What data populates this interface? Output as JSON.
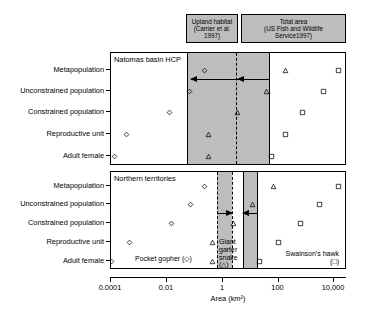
{
  "figure": {
    "xlabel": "Area (km²)",
    "headers": [
      {
        "id": "upland",
        "line1": "Upland habitat",
        "line2": "(Carrier et al. 1997)"
      },
      {
        "id": "total",
        "line1": "Total area",
        "line2": "(US Fish and Wildlife",
        "line3": "Service1997)"
      }
    ],
    "x_ticks": [
      {
        "label": "0.0001",
        "value": 0.0001
      },
      {
        "label": "0.01",
        "value": 0.01
      },
      {
        "label": "1",
        "value": 1
      },
      {
        "label": "100",
        "value": 100
      },
      {
        "label": "10,000",
        "value": 10000
      }
    ],
    "categories": [
      "Metapopulation",
      "Unconstrained population",
      "Constrained population",
      "Reproductive unit",
      "Adult female"
    ],
    "legend": [
      {
        "name": "pocket-gopher",
        "label": "Pocket gopher",
        "symbol": "◇",
        "marker": "diamond"
      },
      {
        "name": "giant-garter-snake",
        "label": "Giant garter snake",
        "symbol": "△",
        "marker": "triangle"
      },
      {
        "name": "swainsons-hawk",
        "label": "Swainson's hawk",
        "symbol": "□",
        "marker": "square"
      }
    ]
  },
  "panels": [
    {
      "id": "natomas",
      "title": "Natomas basin HCP",
      "bands": [
        {
          "name": "upland-habitat-band",
          "x_start": 186,
          "x_end": 268,
          "left_edge": "solid",
          "right_edge": "solid",
          "divider_x": 235,
          "divider_style": "dotted"
        }
      ],
      "arrows": [
        {
          "name": "upland-arrow",
          "from_x": 237,
          "to_x": 190,
          "row": 0,
          "direction": "left"
        },
        {
          "name": "total-area-arrow",
          "from_x": 268,
          "to_x": 237,
          "row": 0,
          "direction": "left"
        }
      ],
      "series": [
        {
          "name": "pocket-gopher",
          "marker": "diamond",
          "points": [
            203,
            188,
            168,
            125,
            113
          ]
        },
        {
          "name": "giant-garter-snake",
          "marker": "triangle",
          "points": [
            284,
            265,
            236,
            207,
            207
          ]
        },
        {
          "name": "swainsons-hawk",
          "marker": "square",
          "points": [
            337,
            322,
            301,
            284,
            270
          ]
        }
      ]
    },
    {
      "id": "northern",
      "title": "Northern territories",
      "bands": [
        {
          "name": "upland-habitat-band",
          "x_start": 216,
          "x_end": 231,
          "left_edge": "dotted",
          "right_edge": "dotted"
        },
        {
          "name": "total-area-band",
          "x_start": 242,
          "x_end": 256,
          "left_edge": "solid",
          "right_edge": "solid"
        }
      ],
      "arrows": [
        {
          "name": "upland-arrow",
          "from_x": 216,
          "to_x": 231,
          "row": 1,
          "direction": "right"
        },
        {
          "name": "total-area-arrow",
          "from_x": 256,
          "to_x": 242,
          "row": 1,
          "direction": "left"
        }
      ],
      "series": [
        {
          "name": "pocket-gopher",
          "marker": "diamond",
          "points": [
            203,
            189,
            170,
            128,
            110
          ]
        },
        {
          "name": "giant-garter-snake",
          "marker": "triangle",
          "points": [
            272,
            251,
            232,
            211,
            211
          ]
        },
        {
          "name": "swainsons-hawk",
          "marker": "square",
          "points": [
            337,
            318,
            299,
            277,
            258
          ]
        }
      ]
    }
  ],
  "colors": {
    "band_fill": "#bdbdbd",
    "header_fill": "#bdbdbd",
    "line": "#000000",
    "background": "#ffffff"
  }
}
